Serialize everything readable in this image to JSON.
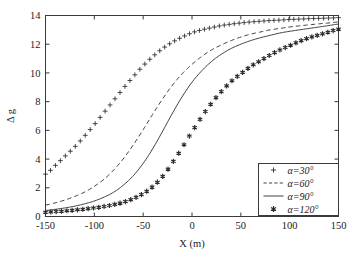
{
  "chart_data": {
    "type": "line",
    "title": "",
    "xlabel": "X (m)",
    "ylabel": "Δ g",
    "xlim": [
      -150,
      150
    ],
    "ylim": [
      0,
      14
    ],
    "xticks": [
      -150,
      -100,
      -50,
      0,
      50,
      100,
      150
    ],
    "xticklabels": [
      "-150",
      "-100",
      "-50",
      "0",
      "50",
      "100",
      "150"
    ],
    "yticks": [
      0,
      2,
      4,
      6,
      8,
      10,
      12,
      14
    ],
    "yticklabels": [
      "0",
      "2",
      "4",
      "6",
      "8",
      "10",
      "12",
      "14"
    ],
    "grid": false,
    "legend_position": "lower right",
    "x": [
      -150,
      -140,
      -130,
      -120,
      -110,
      -100,
      -90,
      -80,
      -70,
      -60,
      -50,
      -40,
      -30,
      -20,
      -10,
      0,
      10,
      20,
      30,
      40,
      50,
      60,
      70,
      80,
      90,
      100,
      110,
      120,
      130,
      140,
      150
    ],
    "series": [
      {
        "name": "α=30°",
        "label": "α=30°",
        "style": "marker-plus",
        "marker": "+",
        "linestyle": "none",
        "values": [
          2.95,
          3.55,
          4.2,
          4.85,
          5.6,
          6.4,
          7.25,
          8.1,
          8.95,
          9.75,
          10.5,
          11.15,
          11.7,
          12.15,
          12.5,
          12.8,
          13.0,
          13.15,
          13.3,
          13.4,
          13.48,
          13.55,
          13.6,
          13.65,
          13.68,
          13.72,
          13.75,
          13.78,
          13.8,
          13.82,
          13.85
        ]
      },
      {
        "name": "α=60°",
        "label": "α=60°",
        "style": "dashed",
        "marker": "none",
        "linestyle": "--",
        "values": [
          0.8,
          0.95,
          1.15,
          1.4,
          1.7,
          2.1,
          2.6,
          3.25,
          4.05,
          5.0,
          6.05,
          7.15,
          8.2,
          9.15,
          9.95,
          10.6,
          11.15,
          11.6,
          11.95,
          12.25,
          12.5,
          12.7,
          12.85,
          13.0,
          13.1,
          13.2,
          13.28,
          13.35,
          13.42,
          13.48,
          13.55
        ]
      },
      {
        "name": "α=90°",
        "label": "α=90°",
        "style": "solid",
        "marker": "none",
        "linestyle": "-",
        "values": [
          0.42,
          0.5,
          0.6,
          0.72,
          0.88,
          1.08,
          1.35,
          1.7,
          2.2,
          2.85,
          3.7,
          4.75,
          5.95,
          7.2,
          8.35,
          9.35,
          10.15,
          10.8,
          11.3,
          11.7,
          12.0,
          12.25,
          12.45,
          12.62,
          12.78,
          12.9,
          13.0,
          13.1,
          13.2,
          13.3,
          13.4
        ]
      },
      {
        "name": "α=120°",
        "label": "α=120°",
        "style": "marker-star",
        "marker": "*",
        "linestyle": "none",
        "values": [
          0.3,
          0.34,
          0.39,
          0.45,
          0.52,
          0.6,
          0.7,
          0.83,
          1.0,
          1.25,
          1.6,
          2.1,
          2.8,
          3.75,
          4.8,
          5.9,
          6.95,
          7.9,
          8.7,
          9.4,
          9.95,
          10.45,
          10.85,
          11.25,
          11.6,
          11.9,
          12.2,
          12.45,
          12.65,
          12.85,
          13.05
        ]
      }
    ]
  },
  "legend": {
    "entries": [
      {
        "label": "α=30°",
        "glyph": "+"
      },
      {
        "label": "α=60°",
        "glyph": "dash"
      },
      {
        "label": "α=90°",
        "glyph": "line"
      },
      {
        "label": "α=120°",
        "glyph": "*"
      }
    ]
  },
  "colors": {
    "background": "#ffffff",
    "axis": "#3a3a3a",
    "curve": "#2b2b2b",
    "text": "#222222"
  }
}
